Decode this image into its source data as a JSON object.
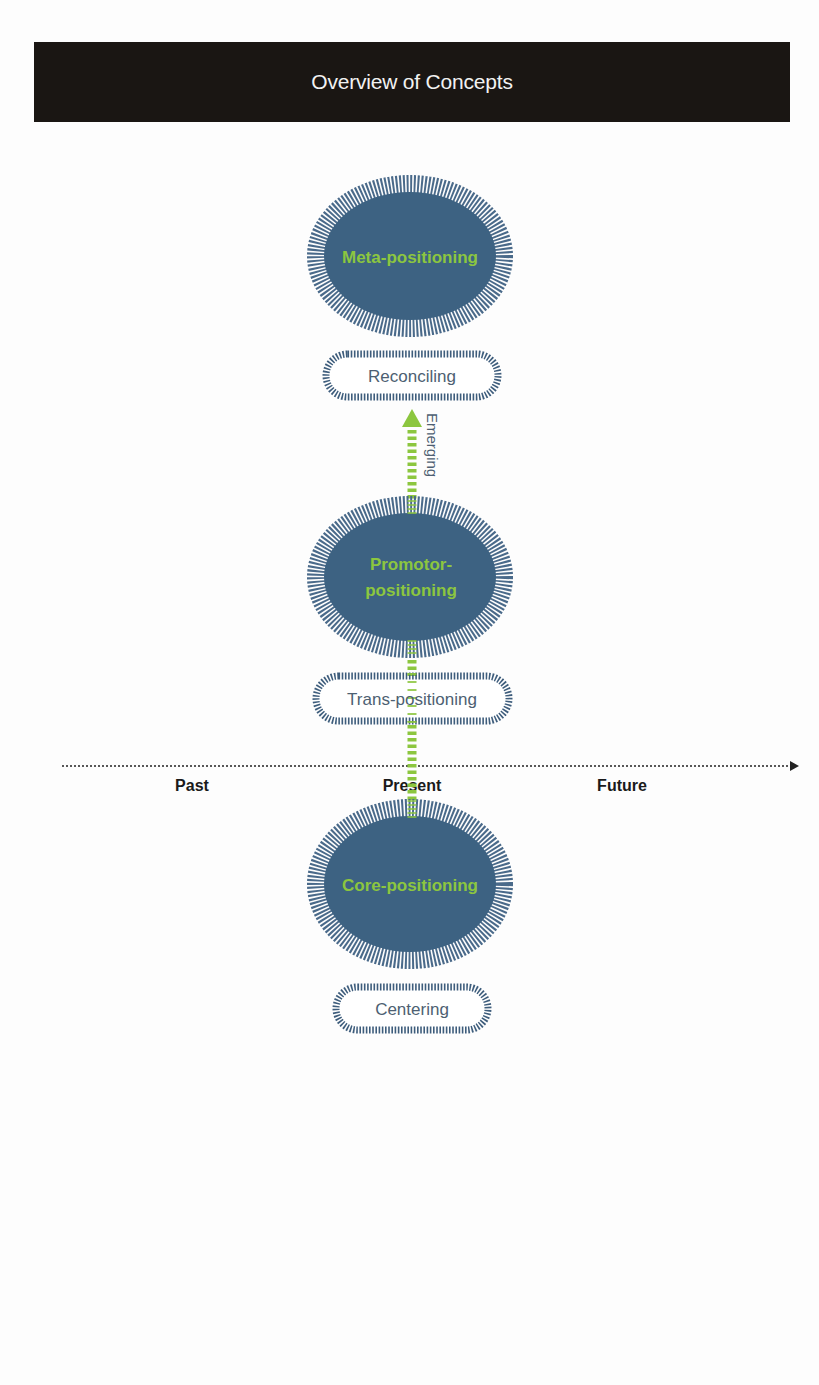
{
  "header": {
    "title": "Overview of Concepts"
  },
  "colors": {
    "title_bg": "#1a1613",
    "title_text": "#f2f2f2",
    "ellipse_fill": "#3d6282",
    "ellipse_hatch": "#4a6a8a",
    "pill_hatch": "#3e5d7c",
    "pill_text": "#4d5f72",
    "ellipse_text": "#8cc63f",
    "arrow_green": "#8cc63f",
    "axis": "#222222"
  },
  "diagram": {
    "ellipses": [
      {
        "id": "meta",
        "label_lines": [
          "Meta-positioning"
        ]
      },
      {
        "id": "promotor",
        "label_lines": [
          "Promotor-",
          "positioning"
        ]
      },
      {
        "id": "core",
        "label_lines": [
          "Core-positioning"
        ]
      }
    ],
    "pills": [
      {
        "id": "reconciling",
        "label": "Reconciling"
      },
      {
        "id": "trans",
        "label": "Trans-positioning"
      },
      {
        "id": "centering",
        "label": "Centering"
      }
    ],
    "arrow": {
      "label": "Emerging"
    },
    "timeline": {
      "labels": [
        "Past",
        "Present",
        "Future"
      ]
    }
  }
}
